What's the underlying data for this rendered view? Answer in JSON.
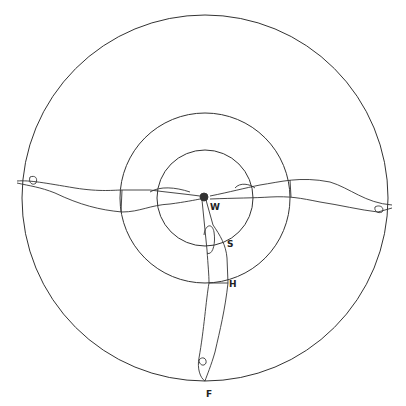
{
  "diagram": {
    "circles": [
      {
        "name": "outer",
        "cx": 205,
        "cy": 198,
        "r": 183
      },
      {
        "name": "middle",
        "cx": 205,
        "cy": 198,
        "r": 85
      },
      {
        "name": "inner",
        "cx": 205,
        "cy": 198,
        "r": 48
      }
    ],
    "labels": [
      {
        "id": "W",
        "text": "W",
        "x": 210,
        "y": 202
      },
      {
        "id": "S",
        "text": "S",
        "x": 227,
        "y": 239
      },
      {
        "id": "H",
        "text": "H",
        "x": 229,
        "y": 279
      },
      {
        "id": "F",
        "text": "F",
        "x": 206,
        "y": 389
      }
    ],
    "stroke_color": "#333333"
  }
}
